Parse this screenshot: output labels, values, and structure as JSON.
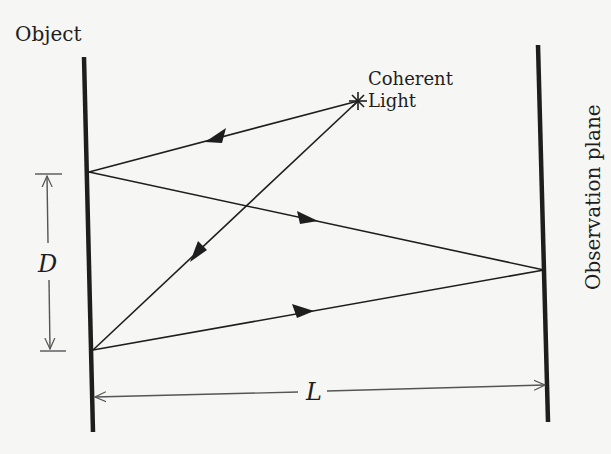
{
  "figure": {
    "type": "double-slit interference schematic",
    "labels": {
      "object": "Object",
      "light_source_line1": "Coherent",
      "light_source_line2": "Light",
      "observation_plane": "Observation plane",
      "slit_separation": "D",
      "distance": "L"
    },
    "elements": {
      "object_plane": {
        "x1": 84,
        "y1": 57,
        "x2": 93,
        "y2": 432
      },
      "observation_plane": {
        "x1": 538,
        "y1": 45,
        "x2": 548,
        "y2": 422
      },
      "light_source": {
        "x": 358,
        "y": 101,
        "glyph": "asterisk"
      },
      "upper_point": {
        "x": 88,
        "y": 172
      },
      "lower_point": {
        "x": 92,
        "y": 350
      },
      "screen_point": {
        "x": 545,
        "y": 270
      }
    },
    "rays": [
      {
        "from": "light_source",
        "to": "upper_point",
        "arrow": "toward upper_point"
      },
      {
        "from": "light_source",
        "to": "lower_point",
        "arrow": "toward lower_point"
      },
      {
        "from": "upper_point",
        "to": "screen_point",
        "arrow": "toward screen_point"
      },
      {
        "from": "lower_point",
        "to": "screen_point",
        "arrow": "toward screen_point"
      }
    ],
    "dimensions": {
      "D": {
        "between": [
          "upper_point",
          "lower_point"
        ],
        "x": 48
      },
      "L": {
        "between": [
          "object_plane",
          "observation_plane"
        ],
        "y": 394
      }
    },
    "colors": {
      "background": "#f6f6f4",
      "ink": "#1e1e1e",
      "dimension_ink": "#555555"
    }
  }
}
